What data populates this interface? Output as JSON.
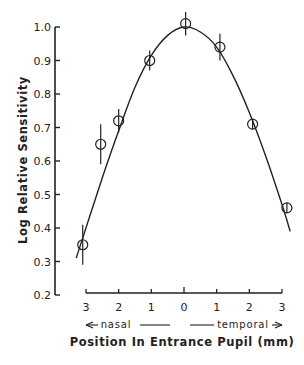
{
  "chart_data": {
    "type": "scatter",
    "title": "",
    "xlabel": "Position In Entrance Pupil (mm)",
    "ylabel": "Log Relative Sensitivity",
    "x_direction_labels": {
      "left": "nasal",
      "right": "temporal"
    },
    "x_ticks": [
      -3,
      -2,
      -1,
      0,
      1,
      2,
      3
    ],
    "x_tick_labels": [
      "3",
      "2",
      "1",
      "0",
      "1",
      "2",
      "3"
    ],
    "y_ticks": [
      0.2,
      0.3,
      0.4,
      0.5,
      0.6,
      0.7,
      0.8,
      0.9,
      1.0
    ],
    "y_tick_labels": [
      "0.2",
      "0.3",
      "0.4",
      "0.5",
      "0.6",
      "0.7",
      "0.8",
      "0.9",
      "1.0"
    ],
    "xlim": [
      -3,
      3
    ],
    "ylim": [
      0.2,
      1.0
    ],
    "grid": false,
    "legend": null,
    "series": [
      {
        "name": "measured",
        "marker": "open-circle",
        "x": [
          -3.1,
          -2.55,
          -2.0,
          -1.05,
          0.05,
          1.1,
          2.1,
          3.15
        ],
        "y": [
          0.35,
          0.65,
          0.72,
          0.9,
          1.01,
          0.94,
          0.71,
          0.46
        ],
        "error": [
          0.06,
          0.06,
          0.035,
          0.03,
          0.035,
          0.04,
          0.015,
          0.015
        ]
      },
      {
        "name": "fitted-curve",
        "type": "line",
        "x": [
          -3.3,
          -2.5,
          -2.0,
          -1.5,
          -1.0,
          -0.5,
          0.0,
          0.5,
          1.0,
          1.5,
          2.0,
          2.5,
          3.0,
          3.25
        ],
        "y": [
          0.31,
          0.55,
          0.69,
          0.82,
          0.915,
          0.975,
          1.0,
          0.985,
          0.94,
          0.855,
          0.745,
          0.615,
          0.47,
          0.39
        ]
      }
    ]
  }
}
